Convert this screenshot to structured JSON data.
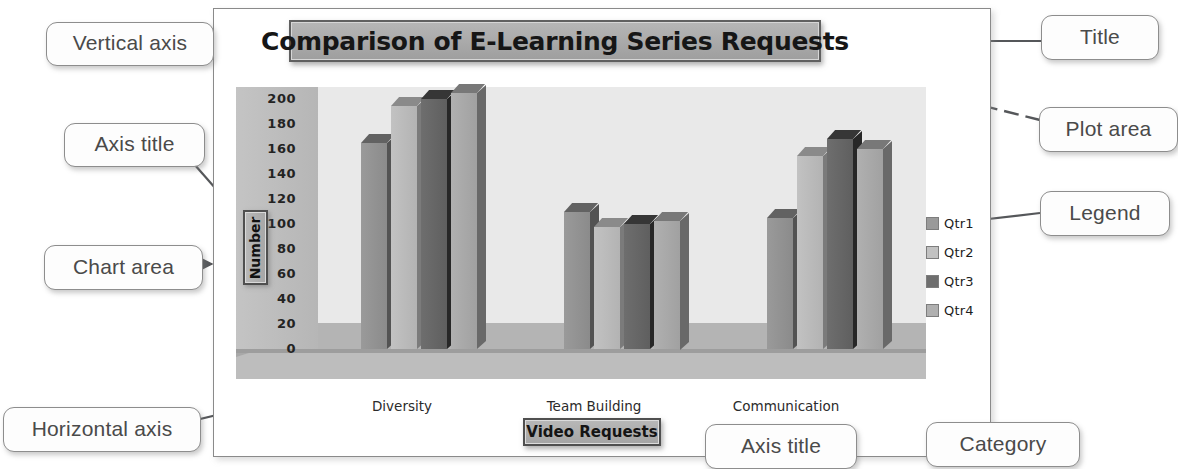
{
  "chart_data": {
    "type": "bar",
    "title": "Comparison of E-Learning Series Requests",
    "xlabel": "Video Requests",
    "ylabel": "Number",
    "categories": [
      "Diversity",
      "Team Building",
      "Communication"
    ],
    "series": [
      {
        "name": "Qtr1",
        "color": "#9a9a9a",
        "values": [
          165,
          110,
          105
        ]
      },
      {
        "name": "Qtr2",
        "color": "#c2c2c2",
        "values": [
          195,
          98,
          155
        ]
      },
      {
        "name": "Qtr3",
        "color": "#6e6e6e",
        "values": [
          200,
          100,
          168
        ]
      },
      {
        "name": "Qtr4",
        "color": "#b0b0b0",
        "values": [
          205,
          103,
          160
        ]
      }
    ],
    "yticks": [
      200,
      180,
      160,
      140,
      120,
      100,
      80,
      60,
      40,
      20,
      0
    ],
    "ylim": [
      0,
      210
    ],
    "grid": false,
    "legend_position": "right",
    "style": "3d-clustered-column-grayscale"
  },
  "annotations": {
    "vertical_axis": "Vertical axis",
    "axis_title_left": "Axis title",
    "chart_area": "Chart area",
    "horizontal_axis": "Horizontal axis",
    "title": "Title",
    "plot_area": "Plot area",
    "legend": "Legend",
    "axis_title_bottom": "Axis title",
    "category": "Category"
  },
  "colors": {
    "callout_border": "#8d8d8d",
    "callout_text": "#4a4a4a",
    "leader_line": "#55575a",
    "chart_area_border": "#8a8a8a",
    "plot_wall": "#e9e9e9",
    "plot_side": "#bdbdbd",
    "title_box_fill": "#ababab"
  }
}
